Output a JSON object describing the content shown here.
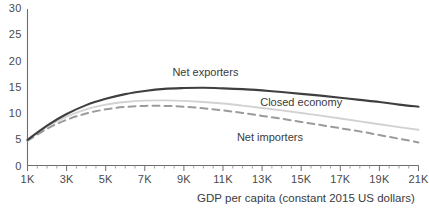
{
  "chart_data": {
    "type": "line",
    "title": "",
    "subtitle": "",
    "xlabel": "GDP per capita (constant 2015 US dollars)",
    "ylabel": "",
    "xlim": [
      1000,
      21000
    ],
    "ylim": [
      0,
      30
    ],
    "grid": false,
    "legend_position": "inline-annotations",
    "x_tick_labels": [
      "1K",
      "3K",
      "5K",
      "7K",
      "9K",
      "11K",
      "13K",
      "15K",
      "17K",
      "19K",
      "21K"
    ],
    "x_tick_values": [
      1000,
      3000,
      5000,
      7000,
      9000,
      11000,
      13000,
      15000,
      17000,
      19000,
      21000
    ],
    "x_minor_tick_values": [
      2000,
      4000,
      6000,
      8000,
      10000,
      12000,
      14000,
      16000,
      18000,
      20000
    ],
    "y_tick_labels": [
      "0",
      "5",
      "10",
      "15",
      "20",
      "25",
      "30"
    ],
    "y_tick_values": [
      0,
      5,
      10,
      15,
      20,
      25,
      30
    ],
    "x": [
      1000,
      2000,
      3000,
      4000,
      5000,
      6000,
      7000,
      8000,
      9000,
      10000,
      11000,
      12000,
      13000,
      14000,
      15000,
      16000,
      17000,
      18000,
      19000,
      20000,
      21000
    ],
    "series": [
      {
        "name": "Net exporters",
        "color": "#3f3f3f",
        "width": 2.1,
        "dash": "none",
        "label_x": 10100,
        "label_y": 17.1,
        "values": [
          4.9,
          7.6,
          9.8,
          11.5,
          12.7,
          13.6,
          14.2,
          14.6,
          14.75,
          14.8,
          14.7,
          14.55,
          14.3,
          14.0,
          13.65,
          13.3,
          12.9,
          12.5,
          12.1,
          11.6,
          11.2
        ]
      },
      {
        "name": "Closed economy",
        "color": "#d2d2d2",
        "width": 1.9,
        "dash": "none",
        "label_x": 15000,
        "label_y": 11.3,
        "values": [
          4.9,
          7.4,
          9.3,
          10.7,
          11.6,
          12.1,
          12.35,
          12.4,
          12.3,
          12.1,
          11.8,
          11.4,
          10.95,
          10.5,
          10.0,
          9.5,
          8.95,
          8.4,
          7.85,
          7.3,
          6.8
        ]
      },
      {
        "name": "Net importers",
        "color": "#9b9b9b",
        "width": 2.0,
        "dash": "7,5",
        "label_x": 13400,
        "label_y": 4.6,
        "values": [
          4.7,
          7.0,
          8.7,
          9.9,
          10.7,
          11.15,
          11.35,
          11.35,
          11.2,
          10.9,
          10.5,
          10.0,
          9.45,
          8.9,
          8.3,
          7.7,
          7.1,
          6.5,
          5.8,
          5.1,
          4.4
        ]
      }
    ]
  },
  "axis": {
    "x_title": "GDP per capita (constant 2015 US dollars)"
  },
  "colors": {
    "axis": "#6e6e6e",
    "text": "#3b3b3b",
    "net_exporters": "#3f3f3f",
    "closed_economy": "#d2d2d2",
    "net_importers": "#9b9b9b",
    "background": "#ffffff"
  }
}
